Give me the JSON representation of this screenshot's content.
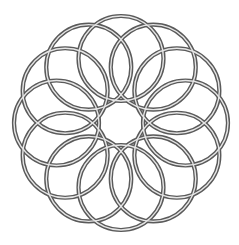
{
  "figure": {
    "kind": "circle-rosette",
    "background": "#ffffff",
    "circle_count": 12,
    "center": [
      121,
      123
    ],
    "ring_radius": 64.5,
    "circle_radius": 42.5,
    "start_angle_deg": -90,
    "stroke": {
      "outer_color": "#5a5a5a",
      "outer_width": 4.2,
      "inner_color": "#e6e6e6",
      "inner_width": 1.4
    }
  }
}
